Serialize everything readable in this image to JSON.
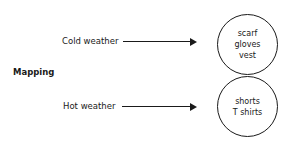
{
  "diagram": {
    "title": "Mapping",
    "rows": [
      {
        "label": "Cold weather",
        "items": [
          "scarf",
          "gloves",
          "vest"
        ]
      },
      {
        "label": "Hot weather",
        "items": [
          "shorts",
          "T shirts"
        ]
      }
    ]
  }
}
